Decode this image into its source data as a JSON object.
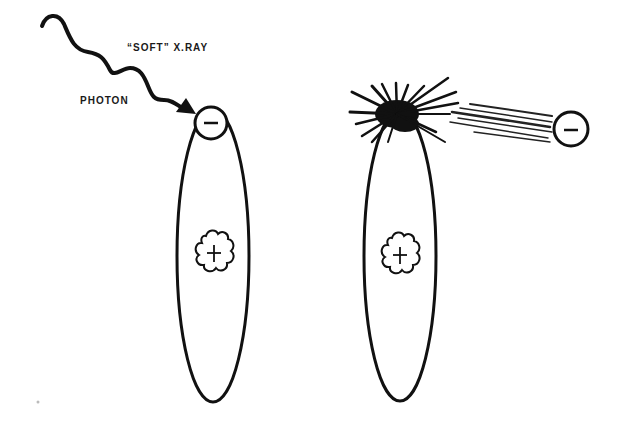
{
  "diagram": {
    "labels": {
      "soft_xray": "“SOFT” X.RAY",
      "photon": "PHOTON"
    },
    "panels": [
      {
        "name": "before",
        "electron_charge": "−",
        "nucleus_charge": "+",
        "description": "Soft X-ray photon striking an orbiting electron"
      },
      {
        "name": "after",
        "electron_charge": "−",
        "nucleus_charge": "+",
        "description": "Electron ejected from atom after absorbing photon"
      }
    ],
    "colors": {
      "ink": "#111111",
      "background": "#ffffff"
    }
  }
}
